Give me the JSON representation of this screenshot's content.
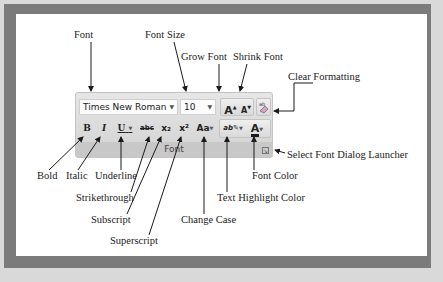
{
  "ribbon": {
    "group_label": "Font",
    "font_name": "Times New Roman",
    "font_size": "10",
    "buttons": {
      "bold": "B",
      "italic": "I",
      "underline": "U",
      "strikethrough": "abc",
      "subscript": "x₂",
      "superscript": "x²",
      "change_case": "Aa",
      "highlight": "ab",
      "font_color": "A",
      "grow": "A",
      "shrink": "A"
    }
  },
  "callouts": {
    "font": "Font",
    "font_size": "Font Size",
    "grow_font": "Grow Font",
    "shrink_font": "Shrink Font",
    "clear_formatting": "Clear Formatting",
    "bold": "Bold",
    "italic": "Italic",
    "underline": "Underline",
    "strikethrough": "Strikethrough",
    "subscript": "Subscript",
    "superscript": "Superscript",
    "change_case": "Change Case",
    "text_highlight_color": "Text Highlight Color",
    "font_color": "Font Color",
    "dialog_launcher": "Select Font Dialog Launcher"
  },
  "colors": {
    "frame": "#7b7b7b",
    "paper": "#ffffff",
    "font_color_bar": "#c00000"
  }
}
